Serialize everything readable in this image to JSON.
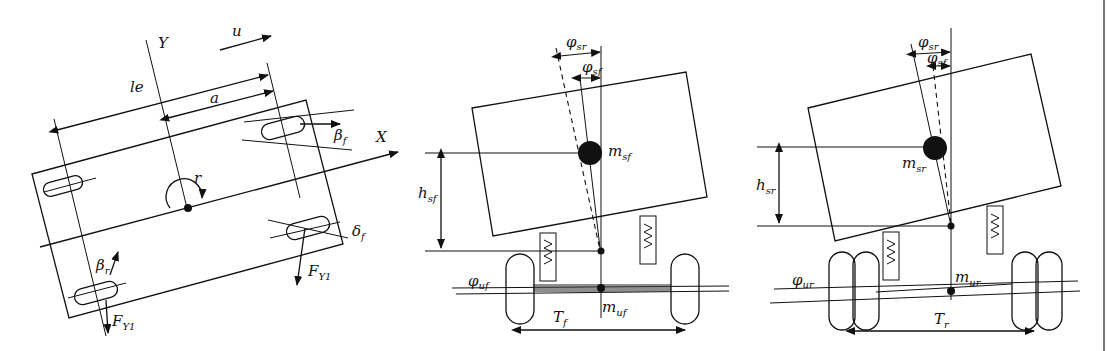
{
  "figure": {
    "panels": [
      {
        "id": "top-view",
        "labels": {
          "Y": "Y",
          "X": "X",
          "u": "u",
          "le": "le",
          "a": "a",
          "r": "r",
          "beta_f": "β",
          "beta_f_sub": "f",
          "beta_r": "β",
          "beta_r_sub": "r",
          "delta_f": "δ",
          "delta_f_sub": "f",
          "F_front": "F",
          "F_front_sub": "Y1",
          "F_rear": "F",
          "F_rear_sub": "Y1"
        }
      },
      {
        "id": "front-axle-roll",
        "labels": {
          "phi_sr": "φ",
          "phi_sr_sub": "sr",
          "phi_sf": "φ",
          "phi_sf_sub": "sf",
          "m_sf": "m",
          "m_sf_sub": "sf",
          "h_sf": "h",
          "h_sf_sub": "sf",
          "phi_uf": "φ",
          "phi_uf_sub": "uf",
          "m_uf": "m",
          "m_uf_sub": "uf",
          "T_f": "T",
          "T_f_sub": "f"
        }
      },
      {
        "id": "rear-axle-roll",
        "labels": {
          "phi_sr": "φ",
          "phi_sr_sub": "sr",
          "phi_sf": "φ",
          "phi_sf_sub": "sf",
          "m_sr": "m",
          "m_sr_sub": "sr",
          "h_sr": "h",
          "h_sr_sub": "sr",
          "phi_ur": "φ",
          "phi_ur_sub": "ur",
          "m_ur": "m",
          "m_ur_sub": "ur",
          "T_r": "T",
          "T_r_sub": "r"
        }
      }
    ]
  }
}
